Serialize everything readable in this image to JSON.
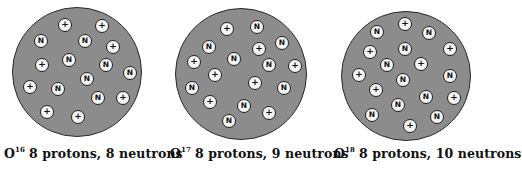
{
  "diagram": {
    "legend": {
      "proton_symbol": "+",
      "neutron_symbol": "N"
    },
    "isotopes": [
      {
        "element": "O",
        "mass_number": "16",
        "description": "8 protons, 8 neutrons",
        "protons": 8,
        "neutrons": 8,
        "nucleus": {
          "cx": 77,
          "cy": 72,
          "r": 65
        },
        "label_x": 4,
        "particles": [
          {
            "t": "+",
            "x": 65,
            "y": 25
          },
          {
            "t": "+",
            "x": 102,
            "y": 26
          },
          {
            "t": "N",
            "x": 41,
            "y": 41
          },
          {
            "t": "N",
            "x": 85,
            "y": 41
          },
          {
            "t": "+",
            "x": 113,
            "y": 47
          },
          {
            "t": "+",
            "x": 42,
            "y": 65
          },
          {
            "t": "N",
            "x": 69,
            "y": 60
          },
          {
            "t": "N",
            "x": 106,
            "y": 65
          },
          {
            "t": "N",
            "x": 130,
            "y": 73
          },
          {
            "t": "N",
            "x": 87,
            "y": 79
          },
          {
            "t": "+",
            "x": 30,
            "y": 87
          },
          {
            "t": "N",
            "x": 58,
            "y": 89
          },
          {
            "t": "N",
            "x": 98,
            "y": 98
          },
          {
            "t": "+",
            "x": 123,
            "y": 98
          },
          {
            "t": "+",
            "x": 47,
            "y": 112
          },
          {
            "t": "+",
            "x": 78,
            "y": 117
          }
        ]
      },
      {
        "element": "O",
        "mass_number": "17",
        "description": "8 protons, 9 neutrons",
        "protons": 8,
        "neutrons": 9,
        "nucleus": {
          "cx": 241,
          "cy": 74,
          "r": 66
        },
        "label_x": 170,
        "particles": [
          {
            "t": "+",
            "x": 227,
            "y": 29
          },
          {
            "t": "N",
            "x": 257,
            "y": 27
          },
          {
            "t": "N",
            "x": 209,
            "y": 47
          },
          {
            "t": "+",
            "x": 259,
            "y": 49
          },
          {
            "t": "N",
            "x": 282,
            "y": 43
          },
          {
            "t": "+",
            "x": 194,
            "y": 62
          },
          {
            "t": "N",
            "x": 234,
            "y": 59
          },
          {
            "t": "N",
            "x": 269,
            "y": 65
          },
          {
            "t": "+",
            "x": 295,
            "y": 66
          },
          {
            "t": "+",
            "x": 215,
            "y": 75
          },
          {
            "t": "+",
            "x": 255,
            "y": 83
          },
          {
            "t": "N",
            "x": 192,
            "y": 88
          },
          {
            "t": "N",
            "x": 284,
            "y": 88
          },
          {
            "t": "+",
            "x": 210,
            "y": 102
          },
          {
            "t": "N",
            "x": 244,
            "y": 106
          },
          {
            "t": "+",
            "x": 269,
            "y": 113
          },
          {
            "t": "N",
            "x": 229,
            "y": 121
          }
        ]
      },
      {
        "element": "O",
        "mass_number": "18",
        "description": "8 protons, 10 neutrons",
        "protons": 8,
        "neutrons": 10,
        "nucleus": {
          "cx": 406,
          "cy": 76,
          "r": 65
        },
        "label_x": 334,
        "particles": [
          {
            "t": "+",
            "x": 405,
            "y": 24
          },
          {
            "t": "N",
            "x": 377,
            "y": 32
          },
          {
            "t": "N",
            "x": 429,
            "y": 33
          },
          {
            "t": "+",
            "x": 370,
            "y": 52
          },
          {
            "t": "N",
            "x": 405,
            "y": 49
          },
          {
            "t": "+",
            "x": 450,
            "y": 49
          },
          {
            "t": "N",
            "x": 387,
            "y": 65
          },
          {
            "t": "+",
            "x": 421,
            "y": 64
          },
          {
            "t": "+",
            "x": 359,
            "y": 75
          },
          {
            "t": "N",
            "x": 403,
            "y": 80
          },
          {
            "t": "N",
            "x": 450,
            "y": 76
          },
          {
            "t": "+",
            "x": 376,
            "y": 90
          },
          {
            "t": "N",
            "x": 426,
            "y": 97
          },
          {
            "t": "+",
            "x": 454,
            "y": 98
          },
          {
            "t": "N",
            "x": 398,
            "y": 105
          },
          {
            "t": "N",
            "x": 372,
            "y": 115
          },
          {
            "t": "N",
            "x": 437,
            "y": 117
          },
          {
            "t": "+",
            "x": 410,
            "y": 126
          }
        ]
      }
    ]
  }
}
